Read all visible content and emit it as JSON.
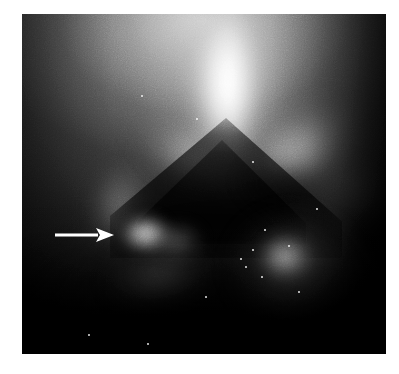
{
  "figure": {
    "kind": "grayscale-medical-scan",
    "modality_appearance": "scintigraphy / nuclear-medicine planar scan",
    "page_background": "#ffffff",
    "plate": {
      "left": 22,
      "top": 14,
      "width": 364,
      "height": 340,
      "base_color": "#0c0c0c",
      "border_color": "#ffffff"
    },
    "caption_text": "",
    "labels": []
  },
  "annotations": {
    "arrow": {
      "name": "pointer-arrow",
      "color": "#ffffff",
      "direction": "right",
      "shaft_start_x": 55,
      "shaft_end_x": 98,
      "tip_x": 114,
      "center_y": 235,
      "shaft_thickness_px": 3,
      "head_length_px": 18,
      "head_height_px": 14,
      "points_at": "bright-focus-left"
    }
  },
  "features": [
    {
      "name": "central-bright-plume",
      "description": "very bright vertical band at top centre",
      "center_x": 205,
      "center_y": 60,
      "intensity": "highest",
      "color": "#ffffff"
    },
    {
      "name": "left-bright-wing",
      "description": "bright band descending to the lower left from the plume",
      "center_x": 150,
      "center_y": 150,
      "intensity": "moderate",
      "color": "#c8c8c8"
    },
    {
      "name": "right-bright-wing",
      "description": "bright band descending to the lower right from the plume",
      "center_x": 300,
      "center_y": 140,
      "intensity": "high",
      "color": "#e0e0e0"
    },
    {
      "name": "central-dark-wedge",
      "description": "dark inverted-V photopenic shadow occupying the centre",
      "apex_x": 205,
      "apex_y": 125,
      "intensity": "dark",
      "color": "#1a1a1a"
    },
    {
      "name": "bright-focus-left",
      "description": "focal bright blob indicated by the arrow",
      "center_x": 135,
      "center_y": 232,
      "intensity": "high",
      "color": "#f4f4f4"
    },
    {
      "name": "bright-focus-right",
      "description": "second focal bright blob lower right",
      "center_x": 278,
      "center_y": 258,
      "intensity": "high",
      "color": "#f0f0f0"
    },
    {
      "name": "dark-lower-field",
      "description": "very dark region across the bottom of the plate",
      "center_x": 200,
      "center_y": 320,
      "intensity": "darkest",
      "color": "#050505"
    }
  ],
  "speckles": [
    {
      "x": 141,
      "y": 95
    },
    {
      "x": 196,
      "y": 118
    },
    {
      "x": 252,
      "y": 161
    },
    {
      "x": 264,
      "y": 229
    },
    {
      "x": 252,
      "y": 249
    },
    {
      "x": 240,
      "y": 258
    },
    {
      "x": 245,
      "y": 266
    },
    {
      "x": 261,
      "y": 276
    },
    {
      "x": 288,
      "y": 245
    },
    {
      "x": 205,
      "y": 296
    },
    {
      "x": 298,
      "y": 291
    },
    {
      "x": 88,
      "y": 334
    },
    {
      "x": 147,
      "y": 343
    },
    {
      "x": 316,
      "y": 208
    }
  ]
}
